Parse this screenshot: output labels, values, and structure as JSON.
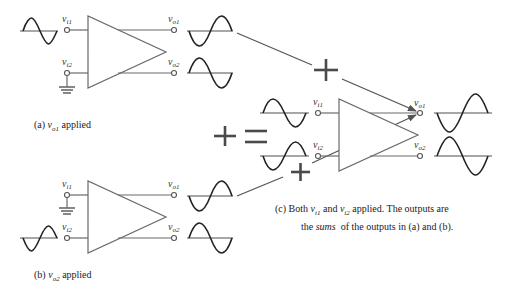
{
  "figure": {
    "panels": [
      {
        "id": "a",
        "caption_prefix": "(a) ",
        "caption_var": "v",
        "caption_sub": "o1",
        "caption_suffix": " applied",
        "inputs": [
          {
            "label": "v",
            "sub": "i1",
            "source": "sine"
          },
          {
            "label": "v",
            "sub": "i2",
            "source": "ground"
          }
        ],
        "outputs": [
          {
            "label": "v",
            "sub": "o1",
            "waveform": "inverted-sine"
          },
          {
            "label": "v",
            "sub": "o2",
            "waveform": "sine"
          }
        ]
      },
      {
        "id": "b",
        "caption_prefix": "(b) ",
        "caption_var": "v",
        "caption_sub": "o2",
        "caption_suffix": " applied",
        "inputs": [
          {
            "label": "v",
            "sub": "i1",
            "source": "ground"
          },
          {
            "label": "v",
            "sub": "i2",
            "source": "inverted-sine"
          }
        ],
        "outputs": [
          {
            "label": "v",
            "sub": "o1",
            "waveform": "inverted-sine"
          },
          {
            "label": "v",
            "sub": "o2",
            "waveform": "sine"
          }
        ]
      },
      {
        "id": "c",
        "caption_line1_prefix": "(c) Both ",
        "caption_var1": "v",
        "caption_sub1": "i1",
        "caption_mid": " and ",
        "caption_var2": "v",
        "caption_sub2": "i2",
        "caption_line1_suffix": " applied. The outputs are",
        "caption_line2_prefix": "the ",
        "caption_line2_em": "sums",
        "caption_line2_suffix": "  of the outputs in (a) and (b).",
        "inputs": [
          {
            "label": "v",
            "sub": "i1",
            "source": "sine"
          },
          {
            "label": "v",
            "sub": "i2",
            "source": "inverted-sine"
          }
        ],
        "outputs": [
          {
            "label": "v",
            "sub": "o1",
            "waveform": "inverted-sine-larger"
          },
          {
            "label": "v",
            "sub": "o2",
            "waveform": "sine-larger"
          }
        ]
      }
    ],
    "operators": {
      "plus_top": "+",
      "plus_bottom": "+",
      "plus_big": "+",
      "equals": "="
    },
    "colors": {
      "wire": "#6a6a6a",
      "wave": "#222222",
      "axis": "#8a8a8a",
      "operator": "#4a4a4a"
    }
  }
}
